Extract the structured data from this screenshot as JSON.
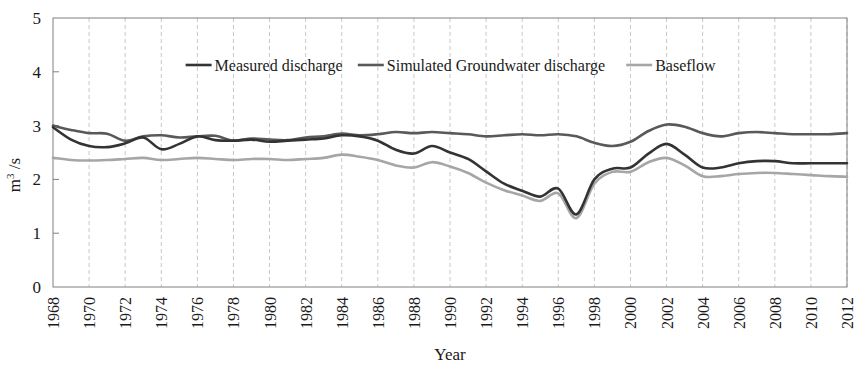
{
  "chart_data": {
    "type": "line",
    "title": "",
    "xlabel": "Year",
    "ylabel": "m3 /s",
    "ylabel_base": "m",
    "ylabel_sup": "3",
    "ylabel_rest": " /s",
    "xlim": [
      1968,
      2012
    ],
    "ylim": [
      0,
      5
    ],
    "yticks": [
      0,
      1,
      2,
      3,
      4,
      5
    ],
    "ytick_labels": [
      "0",
      "1",
      "2",
      "3",
      "4",
      "5"
    ],
    "grid": "vertical-dashed",
    "legend_position": "top-inside",
    "x": [
      1968,
      1969,
      1970,
      1971,
      1972,
      1973,
      1974,
      1975,
      1976,
      1977,
      1978,
      1979,
      1980,
      1981,
      1982,
      1983,
      1984,
      1985,
      1986,
      1987,
      1988,
      1989,
      1990,
      1991,
      1992,
      1993,
      1994,
      1995,
      1996,
      1997,
      1998,
      1999,
      2000,
      2001,
      2002,
      2003,
      2004,
      2005,
      2006,
      2007,
      2008,
      2009,
      2010,
      2011,
      2012
    ],
    "xtick_labels": [
      "1968",
      "1970",
      "1972",
      "1974",
      "1976",
      "1978",
      "1980",
      "1982",
      "1984",
      "1986",
      "1988",
      "1990",
      "1992",
      "1994",
      "1996",
      "1998",
      "2000",
      "2002",
      "2004",
      "2006",
      "2008",
      "2010",
      "2012"
    ],
    "series": [
      {
        "name": "Measured discharge",
        "color": "#333333",
        "width": 2.6,
        "values": [
          2.97,
          2.74,
          2.62,
          2.6,
          2.67,
          2.78,
          2.56,
          2.66,
          2.8,
          2.73,
          2.72,
          2.74,
          2.7,
          2.72,
          2.74,
          2.76,
          2.82,
          2.8,
          2.72,
          2.55,
          2.48,
          2.62,
          2.5,
          2.38,
          2.15,
          1.92,
          1.79,
          1.68,
          1.83,
          1.35,
          2.0,
          2.2,
          2.22,
          2.48,
          2.66,
          2.46,
          2.22,
          2.22,
          2.3,
          2.34,
          2.34,
          2.3,
          2.3,
          2.3,
          2.3
        ]
      },
      {
        "name": "Simulated Groundwater discharge",
        "color": "#595959",
        "width": 2.6,
        "values": [
          3.0,
          2.92,
          2.86,
          2.85,
          2.72,
          2.8,
          2.82,
          2.78,
          2.8,
          2.81,
          2.72,
          2.76,
          2.74,
          2.73,
          2.78,
          2.8,
          2.85,
          2.82,
          2.84,
          2.88,
          2.86,
          2.88,
          2.86,
          2.84,
          2.8,
          2.82,
          2.84,
          2.82,
          2.84,
          2.8,
          2.68,
          2.62,
          2.7,
          2.9,
          3.02,
          2.98,
          2.86,
          2.8,
          2.86,
          2.88,
          2.86,
          2.84,
          2.84,
          2.84,
          2.86
        ]
      },
      {
        "name": "Baseflow",
        "color": "#a6a6a6",
        "width": 2.6,
        "values": [
          2.4,
          2.36,
          2.35,
          2.36,
          2.38,
          2.4,
          2.36,
          2.38,
          2.4,
          2.38,
          2.36,
          2.38,
          2.38,
          2.36,
          2.38,
          2.4,
          2.46,
          2.42,
          2.36,
          2.26,
          2.22,
          2.32,
          2.24,
          2.12,
          1.94,
          1.8,
          1.7,
          1.6,
          1.74,
          1.28,
          1.92,
          2.14,
          2.14,
          2.32,
          2.4,
          2.26,
          2.06,
          2.06,
          2.1,
          2.12,
          2.12,
          2.1,
          2.08,
          2.06,
          2.05
        ]
      }
    ],
    "legend": [
      {
        "label": "Measured discharge",
        "color": "#333333"
      },
      {
        "label": "Simulated Groundwater discharge",
        "color": "#595959"
      },
      {
        "label": "Baseflow",
        "color": "#a6a6a6"
      }
    ]
  }
}
